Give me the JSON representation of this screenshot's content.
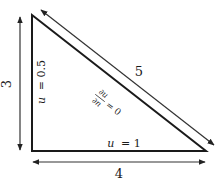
{
  "diagram": {
    "type": "right-triangle-boundary-conditions",
    "colors": {
      "triangle": "#1a1a1a",
      "arrows": "#333333",
      "text": "#1a1a1a"
    },
    "dimensions": {
      "vertical": "3",
      "horizontal": "4",
      "hypotenuse": "5"
    },
    "boundary_conditions": {
      "left_edge": {
        "var": "u",
        "eq": "= 0.5"
      },
      "bottom_edge": {
        "var": "u",
        "eq": "= 1"
      },
      "hypotenuse": {
        "numerator": "∂u",
        "denominator": "∂n",
        "eq": "= 0"
      }
    }
  }
}
